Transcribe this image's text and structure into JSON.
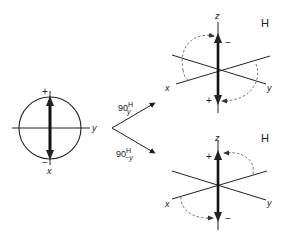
{
  "diagram": {
    "type": "pulse-rotation",
    "colors": {
      "line": "#222222",
      "dashed": "#555555",
      "background": "#ffffff"
    },
    "left": {
      "axes": {
        "horizontal": "y",
        "vertical": "x"
      },
      "plus": "+",
      "minus": "−"
    },
    "arrows": {
      "upper": {
        "base": "90",
        "sup": "H",
        "sub": "y"
      },
      "lower": {
        "base": "90",
        "sup": "H",
        "sub": "−y"
      }
    },
    "top_right": {
      "nucleus": "H",
      "axes": {
        "z": "z",
        "x": "x",
        "y": "y"
      },
      "top_sign": "−",
      "bottom_sign": "+"
    },
    "bottom_right": {
      "nucleus": "H",
      "axes": {
        "z": "z",
        "x": "x",
        "y": "y"
      },
      "top_sign": "+",
      "bottom_sign": "−"
    }
  }
}
